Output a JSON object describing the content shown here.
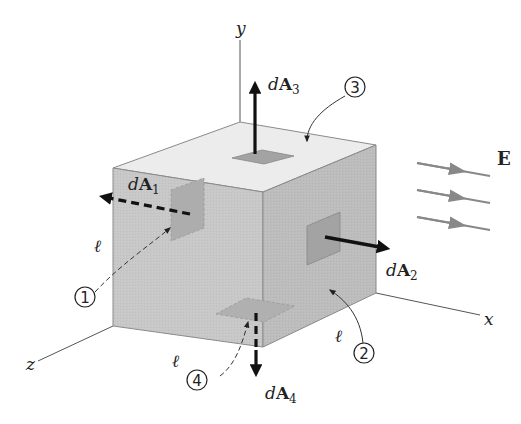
{
  "figure": {
    "axes": {
      "x_label": "x",
      "y_label": "y",
      "z_label": "z"
    },
    "field": {
      "label": "E",
      "arrow_count": 3,
      "direction": "+x"
    },
    "edge_label": "ℓ",
    "edge_labels": [
      "ℓ",
      "ℓ",
      "ℓ"
    ],
    "area_vectors": [
      {
        "id": 1,
        "label_prefix": "d",
        "label_main": "A",
        "label_sub": "1",
        "marker": "1",
        "face": "left (hidden, -x)",
        "style": "dashed"
      },
      {
        "id": 2,
        "label_prefix": "d",
        "label_main": "A",
        "label_sub": "2",
        "marker": "2",
        "face": "right (+x)",
        "style": "solid"
      },
      {
        "id": 3,
        "label_prefix": "d",
        "label_main": "A",
        "label_sub": "3",
        "marker": "3",
        "face": "top (+y)",
        "style": "solid"
      },
      {
        "id": 4,
        "label_prefix": "d",
        "label_main": "A",
        "label_sub": "4",
        "marker": "4",
        "face": "bottom (hidden, -y)",
        "style": "dashed"
      }
    ],
    "colors": {
      "face_top": "#ececec",
      "face_front_left": "#c6c6c6",
      "face_right": "#bdbdbd",
      "patch": "#a3a3a3",
      "edge": "#6e6e6e",
      "arrow": "#111111",
      "field_arrow": "#888888",
      "axis": "#555555"
    }
  }
}
